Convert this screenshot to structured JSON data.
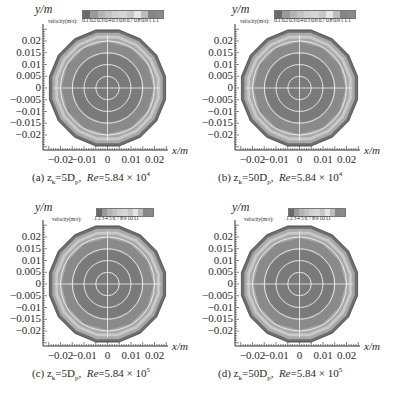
{
  "figure": {
    "y_axis_label": "y/m",
    "x_axis_label": "x/m",
    "colorbar_label": "velocity(m/s):"
  },
  "panels": [
    {
      "id": "a",
      "colorbar_ticks": "0.1 0.2 0.3 0.4 0.5 0.6 0.7 0.8 0.9 1 1.1",
      "caption_prefix": "(a) z",
      "caption_sub": "k",
      "caption_mid": "=5D",
      "caption_mid_sub": "p",
      "caption_re": "Re",
      "caption_val": "=5.84 × 10",
      "caption_exp": "4"
    },
    {
      "id": "b",
      "colorbar_ticks": "0.1 0.2 0.3 0.4 0.5 0.6 0.7 0.8 0.9 1 1.1",
      "caption_prefix": "(b) z",
      "caption_sub": "k",
      "caption_mid": "=50D",
      "caption_mid_sub": "p",
      "caption_re": "Re",
      "caption_val": "=5.84 × 10",
      "caption_exp": "4"
    },
    {
      "id": "c",
      "colorbar_ticks": "1 2 3 4 5 6 7 8 9 10 11",
      "caption_prefix": "(c) z",
      "caption_sub": "k",
      "caption_mid": "=5D",
      "caption_mid_sub": "p",
      "caption_re": "Re",
      "caption_val": "=5.84 × 10",
      "caption_exp": "5"
    },
    {
      "id": "d",
      "colorbar_ticks": "1 2 3 4 5 6 7 8 9 10 11",
      "caption_prefix": "(d) z",
      "caption_sub": "k",
      "caption_mid": "=50D",
      "caption_mid_sub": "p",
      "caption_re": "Re",
      "caption_val": "=5.84 × 10",
      "caption_exp": "5"
    }
  ],
  "axes": {
    "y_ticks": [
      "0.02",
      "0.015",
      "0.01",
      "0.005",
      "0",
      "−0.005",
      "−0.01",
      "−0.015",
      "−0.02"
    ],
    "x_ticks": [
      "−0.02",
      "−0.01",
      "0",
      "0.01",
      "0.02"
    ]
  },
  "colors": {
    "outer_ring": "#6e6e6e",
    "ring_light": "#c9c9c9",
    "ring_mid": "#a9a9a9",
    "body": "#8a8a8a",
    "core": "#7a7a7a",
    "grid_circle": "#f0f0f0"
  },
  "chart_data": [
    {
      "type": "heatmap",
      "title": "(a) zk=5Dp, Re=5.84×10^4",
      "xlabel": "x/m",
      "ylabel": "y/m",
      "xlim": [
        -0.025,
        0.025
      ],
      "ylim": [
        -0.025,
        0.025
      ],
      "x_ticks": [
        -0.02,
        -0.01,
        0,
        0.01,
        0.02
      ],
      "y_ticks": [
        0.02,
        0.015,
        0.01,
        0.005,
        0,
        -0.005,
        -0.01,
        -0.015,
        -0.02
      ],
      "colorbar": {
        "label": "velocity(m/s)",
        "ticks": [
          0.1,
          0.2,
          0.3,
          0.4,
          0.5,
          0.6,
          0.7,
          0.8,
          0.9,
          1,
          1.1
        ]
      },
      "description": "Circular pipe cross-section velocity contour; low velocity near wall, high velocity (~1.0-1.1 m/s) in core",
      "grid_circles_radius_m": [
        0.005,
        0.01,
        0.015,
        0.02
      ]
    },
    {
      "type": "heatmap",
      "title": "(b) zk=50Dp, Re=5.84×10^4",
      "xlabel": "x/m",
      "ylabel": "y/m",
      "xlim": [
        -0.025,
        0.025
      ],
      "ylim": [
        -0.025,
        0.025
      ],
      "x_ticks": [
        -0.02,
        -0.01,
        0,
        0.01,
        0.02
      ],
      "y_ticks": [
        0.02,
        0.015,
        0.01,
        0.005,
        0,
        -0.005,
        -0.01,
        -0.015,
        -0.02
      ],
      "colorbar": {
        "label": "velocity(m/s)",
        "ticks": [
          0.1,
          0.2,
          0.3,
          0.4,
          0.5,
          0.6,
          0.7,
          0.8,
          0.9,
          1,
          1.1
        ]
      },
      "description": "Circular pipe cross-section velocity contour; core region high velocity",
      "grid_circles_radius_m": [
        0.005,
        0.01,
        0.015,
        0.02
      ]
    },
    {
      "type": "heatmap",
      "title": "(c) zk=5Dp, Re=5.84×10^5",
      "xlabel": "x/m",
      "ylabel": "y/m",
      "xlim": [
        -0.025,
        0.025
      ],
      "ylim": [
        -0.025,
        0.025
      ],
      "x_ticks": [
        -0.02,
        -0.01,
        0,
        0.01,
        0.02
      ],
      "y_ticks": [
        0.02,
        0.015,
        0.01,
        0.005,
        0,
        -0.005,
        -0.01,
        -0.015,
        -0.02
      ],
      "colorbar": {
        "label": "velocity(m/s)",
        "ticks": [
          1,
          2,
          3,
          4,
          5,
          6,
          7,
          8,
          9,
          10,
          11
        ]
      },
      "description": "Circular pipe cross-section velocity contour; core ~10-11 m/s",
      "grid_circles_radius_m": [
        0.005,
        0.01,
        0.015,
        0.02
      ]
    },
    {
      "type": "heatmap",
      "title": "(d) zk=50Dp, Re=5.84×10^5",
      "xlabel": "x/m",
      "ylabel": "y/m",
      "xlim": [
        -0.025,
        0.025
      ],
      "ylim": [
        -0.025,
        0.025
      ],
      "x_ticks": [
        -0.02,
        -0.01,
        0,
        0.01,
        0.02
      ],
      "y_ticks": [
        0.02,
        0.015,
        0.01,
        0.005,
        0,
        -0.005,
        -0.01,
        -0.015,
        -0.02
      ],
      "colorbar": {
        "label": "velocity(m/s)",
        "ticks": [
          1,
          2,
          3,
          4,
          5,
          6,
          7,
          8,
          9,
          10,
          11
        ]
      },
      "description": "Circular pipe cross-section velocity contour; core ~10-11 m/s",
      "grid_circles_radius_m": [
        0.005,
        0.01,
        0.015,
        0.02
      ]
    }
  ]
}
